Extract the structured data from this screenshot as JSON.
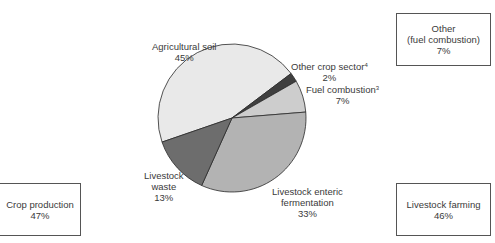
{
  "chart_data": {
    "type": "pie",
    "title": "",
    "slices": [
      {
        "label": "Agricultural soil",
        "value": 45,
        "display": "45%",
        "color": "#e9e9e9"
      },
      {
        "label": "Other crop sector",
        "footnote": "4",
        "value": 2,
        "display": "2%",
        "color": "#3f3f3f"
      },
      {
        "label": "Fuel combustion",
        "footnote": "3",
        "value": 7,
        "display": "7%",
        "color": "#cdcdcd"
      },
      {
        "label": "Livestock enteric fermentation",
        "value": 33,
        "display": "33%",
        "color": "#b3b3b3"
      },
      {
        "label": "Livestock waste",
        "value": 13,
        "display": "13%",
        "color": "#6d6d6d"
      }
    ],
    "groups": [
      {
        "label": "Crop production",
        "value": 47,
        "display": "47%"
      },
      {
        "label": "Other (fuel combustion)",
        "value": 7,
        "display": "7%"
      },
      {
        "label": "Livestock farming",
        "value": 46,
        "display": "46%"
      }
    ]
  },
  "labels": {
    "agricultural_soil": {
      "name": "Agricultural soil",
      "pct": "45%"
    },
    "other_crop": {
      "name": "Other crop sector",
      "sup": "4",
      "pct": "2%"
    },
    "fuel": {
      "name": "Fuel combustion",
      "sup": "3",
      "pct": "7%"
    },
    "enteric": {
      "line1": "Livestock enteric",
      "line2": "fermentation",
      "pct": "33%"
    },
    "waste": {
      "line1": "Livestock",
      "line2": "waste",
      "pct": "13%"
    }
  },
  "boxes": {
    "other": {
      "line1": "Other",
      "line2": "(fuel combustion)",
      "pct": "7%"
    },
    "livestock": {
      "line1": "Livestock farming",
      "pct": "46%"
    },
    "crop": {
      "line1": "Crop production",
      "pct": "47%"
    }
  }
}
